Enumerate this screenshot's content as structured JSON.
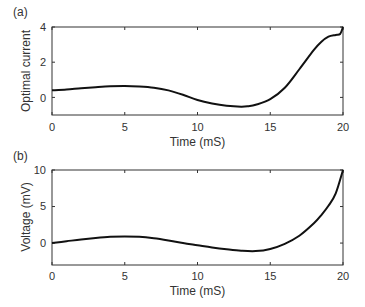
{
  "chart_data": [
    {
      "panel": "(a)",
      "type": "line",
      "title": "",
      "xlabel": "Time (mS)",
      "ylabel": "Optimal current",
      "xlim": [
        0,
        20
      ],
      "ylim": [
        -1,
        4
      ],
      "xticks": [
        0,
        5,
        10,
        15,
        20
      ],
      "yticks": [
        0,
        2,
        4
      ],
      "grid": false,
      "series": [
        {
          "name": "Optimal current",
          "x": [
            0,
            1,
            2,
            3,
            4,
            5,
            6,
            7,
            8,
            9,
            10,
            11,
            12,
            13,
            13.5,
            14,
            15,
            16,
            17,
            18,
            18.5,
            19,
            19.5,
            19.8,
            20
          ],
          "y": [
            0.4,
            0.45,
            0.52,
            0.58,
            0.63,
            0.65,
            0.62,
            0.55,
            0.4,
            0.15,
            -0.15,
            -0.35,
            -0.48,
            -0.53,
            -0.5,
            -0.42,
            -0.1,
            0.55,
            1.6,
            2.7,
            3.15,
            3.45,
            3.55,
            3.6,
            4.0
          ]
        }
      ]
    },
    {
      "panel": "(b)",
      "type": "line",
      "title": "",
      "xlabel": "Time (mS)",
      "ylabel": "Voltage (mV)",
      "xlim": [
        0,
        20
      ],
      "ylim": [
        -3,
        10
      ],
      "xticks": [
        0,
        5,
        10,
        15,
        20
      ],
      "yticks": [
        0,
        5,
        10
      ],
      "grid": false,
      "series": [
        {
          "name": "Voltage",
          "x": [
            0,
            1,
            2,
            3,
            4,
            5,
            6,
            7,
            8,
            9,
            10,
            11,
            12,
            13,
            14,
            15,
            16,
            17,
            18,
            18.5,
            19,
            19.5,
            20
          ],
          "y": [
            0,
            0.25,
            0.5,
            0.7,
            0.85,
            0.9,
            0.85,
            0.65,
            0.35,
            0.0,
            -0.3,
            -0.6,
            -0.85,
            -1.05,
            -1.1,
            -0.8,
            -0.1,
            1.0,
            2.7,
            3.8,
            5.1,
            6.8,
            10.0
          ]
        }
      ]
    }
  ],
  "panels": {
    "a": {
      "label": "(a)",
      "ylabel": "Optimal current",
      "xlabel": "Time (mS)",
      "xtick_labels": [
        "0",
        "5",
        "10",
        "15",
        "20"
      ],
      "ytick_labels": [
        "0",
        "2",
        "4"
      ]
    },
    "b": {
      "label": "(b)",
      "ylabel": "Voltage (mV)",
      "xlabel": "Time (mS)",
      "xtick_labels": [
        "0",
        "5",
        "10",
        "15",
        "20"
      ],
      "ytick_labels": [
        "0",
        "5",
        "10"
      ]
    }
  },
  "colors": {
    "line": "#111111",
    "axis": "#333333"
  }
}
